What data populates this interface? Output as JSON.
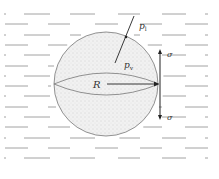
{
  "diagram": {
    "labels": {
      "outer_pressure": "p",
      "outer_pressure_sub": "l",
      "inner_pressure": "p",
      "inner_pressure_sub": "v",
      "radius": "R",
      "tension_top": "σ",
      "tension_bottom": "σ"
    },
    "colors": {
      "outline": "#666666",
      "fill": "#eeeeee",
      "liquid_lines": "#8a8a8a",
      "arrow": "#222222"
    }
  }
}
